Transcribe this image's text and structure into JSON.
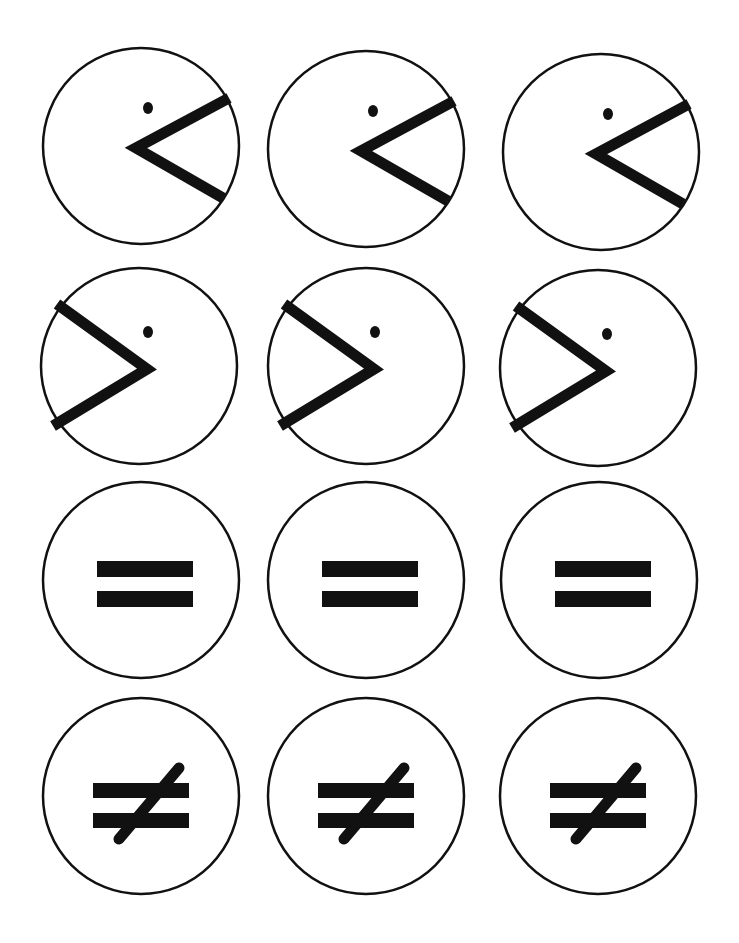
{
  "worksheet": {
    "ink_color": "#111111",
    "paper_color": "#ffffff",
    "rows": [
      {
        "symbol": "greater-than",
        "label": ">",
        "cards": [
          {
            "cx": 141,
            "cy": 146
          },
          {
            "cx": 366,
            "cy": 149
          },
          {
            "cx": 601,
            "cy": 152
          }
        ]
      },
      {
        "symbol": "less-than",
        "label": "<",
        "cards": [
          {
            "cx": 139,
            "cy": 366
          },
          {
            "cx": 366,
            "cy": 366
          },
          {
            "cx": 598,
            "cy": 368
          }
        ]
      },
      {
        "symbol": "equal",
        "label": "=",
        "cards": [
          {
            "cx": 141,
            "cy": 580
          },
          {
            "cx": 366,
            "cy": 580
          },
          {
            "cx": 599,
            "cy": 580
          }
        ]
      },
      {
        "symbol": "not-equal",
        "label": "≠",
        "cards": [
          {
            "cx": 141,
            "cy": 796
          },
          {
            "cx": 366,
            "cy": 796
          },
          {
            "cx": 598,
            "cy": 796
          }
        ]
      }
    ]
  }
}
